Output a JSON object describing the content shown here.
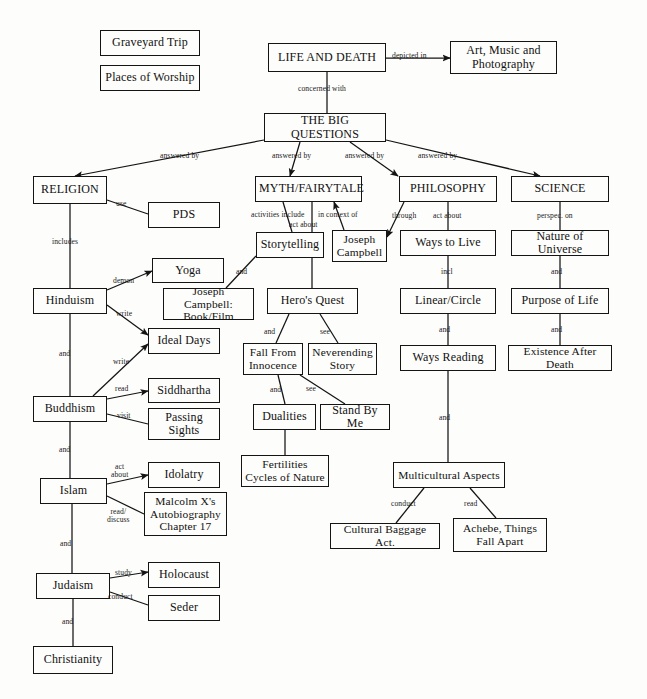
{
  "diagram": {
    "stroke_color": "#141414",
    "background_color": "#fdfdfb",
    "nodes": [
      {
        "id": "graveyard_trip",
        "label": "Graveyard Trip",
        "x": 100,
        "y": 30,
        "w": 100,
        "h": 26,
        "size": "sz-md"
      },
      {
        "id": "places_worship",
        "label": "Places of Worship",
        "x": 100,
        "y": 65,
        "w": 100,
        "h": 26,
        "size": "sz-md"
      },
      {
        "id": "life_and_death",
        "label": "LIFE AND DEATH",
        "x": 268,
        "y": 43,
        "w": 118,
        "h": 29,
        "size": "sz-md"
      },
      {
        "id": "art_music_photography",
        "label": "Art, Music and\nPhotography",
        "x": 450,
        "y": 41,
        "w": 107,
        "h": 33,
        "size": "sz-md"
      },
      {
        "id": "the_big_questions",
        "label": "THE BIG QUESTIONS",
        "x": 264,
        "y": 113,
        "w": 122,
        "h": 29,
        "size": "sz-md"
      },
      {
        "id": "religion",
        "label": "RELIGION",
        "x": 33,
        "y": 176,
        "w": 74,
        "h": 28,
        "size": "sz-md"
      },
      {
        "id": "myth_fairytale",
        "label": "MYTH/FAIRYTALE",
        "x": 255,
        "y": 176,
        "w": 107,
        "h": 26,
        "size": "sz-md"
      },
      {
        "id": "philosophy",
        "label": "PHILOSOPHY",
        "x": 399,
        "y": 176,
        "w": 98,
        "h": 26,
        "size": "sz-md"
      },
      {
        "id": "science",
        "label": "SCIENCE",
        "x": 511,
        "y": 176,
        "w": 98,
        "h": 26,
        "size": "sz-md"
      },
      {
        "id": "pds",
        "label": "PDS",
        "x": 148,
        "y": 202,
        "w": 72,
        "h": 26,
        "size": "sz-md"
      },
      {
        "id": "yoga",
        "label": "Yoga",
        "x": 152,
        "y": 258,
        "w": 72,
        "h": 25,
        "size": "sz-md"
      },
      {
        "id": "joseph_campbell_book",
        "label": "Joseph Campbell:\nBook/Film",
        "x": 163,
        "y": 288,
        "w": 91,
        "h": 32,
        "size": "sz-sm"
      },
      {
        "id": "storytelling",
        "label": "Storytelling",
        "x": 256,
        "y": 232,
        "w": 68,
        "h": 26,
        "size": "sz-md"
      },
      {
        "id": "joseph_campbell",
        "label": "Joseph\nCampbell",
        "x": 332,
        "y": 230,
        "w": 55,
        "h": 32,
        "size": "sz-sm"
      },
      {
        "id": "ways_to_live",
        "label": "Ways to Live",
        "x": 400,
        "y": 230,
        "w": 96,
        "h": 26,
        "size": "sz-md"
      },
      {
        "id": "nature_of_universe",
        "label": "Nature of Universe",
        "x": 511,
        "y": 230,
        "w": 98,
        "h": 26,
        "size": "sz-md"
      },
      {
        "id": "hinduism",
        "label": "Hinduism",
        "x": 33,
        "y": 288,
        "w": 74,
        "h": 26,
        "size": "sz-md"
      },
      {
        "id": "heros_quest",
        "label": "Hero's Quest",
        "x": 267,
        "y": 288,
        "w": 91,
        "h": 26,
        "size": "sz-md"
      },
      {
        "id": "linear_circle",
        "label": "Linear/Circle",
        "x": 400,
        "y": 288,
        "w": 96,
        "h": 26,
        "size": "sz-md"
      },
      {
        "id": "purpose_of_life",
        "label": "Purpose of Life",
        "x": 511,
        "y": 288,
        "w": 98,
        "h": 26,
        "size": "sz-md"
      },
      {
        "id": "ideal_days",
        "label": "Ideal Days",
        "x": 148,
        "y": 328,
        "w": 72,
        "h": 26,
        "size": "sz-md"
      },
      {
        "id": "fall_from_innocence",
        "label": "Fall From\nInnocence",
        "x": 243,
        "y": 343,
        "w": 60,
        "h": 32,
        "size": "sz-sm"
      },
      {
        "id": "neverending_story",
        "label": "Neverending\nStory",
        "x": 308,
        "y": 343,
        "w": 69,
        "h": 32,
        "size": "sz-sm"
      },
      {
        "id": "ways_reading",
        "label": "Ways Reading",
        "x": 400,
        "y": 345,
        "w": 96,
        "h": 26,
        "size": "sz-md"
      },
      {
        "id": "existence_after_death",
        "label": "Existence After Death",
        "x": 508,
        "y": 345,
        "w": 104,
        "h": 26,
        "size": "sz-sm"
      },
      {
        "id": "siddhartha",
        "label": "Siddhartha",
        "x": 148,
        "y": 378,
        "w": 72,
        "h": 25,
        "size": "sz-md"
      },
      {
        "id": "buddhism",
        "label": "Buddhism",
        "x": 33,
        "y": 396,
        "w": 74,
        "h": 26,
        "size": "sz-md"
      },
      {
        "id": "dualities",
        "label": "Dualities",
        "x": 253,
        "y": 404,
        "w": 63,
        "h": 26,
        "size": "sz-md"
      },
      {
        "id": "stand_by_me",
        "label": "Stand By Me",
        "x": 320,
        "y": 404,
        "w": 70,
        "h": 26,
        "size": "sz-md"
      },
      {
        "id": "passing_sights",
        "label": "Passing\nSights",
        "x": 148,
        "y": 408,
        "w": 72,
        "h": 32,
        "size": "sz-md"
      },
      {
        "id": "fertilities_cycles",
        "label": "Fertilities\nCycles of Nature",
        "x": 241,
        "y": 455,
        "w": 88,
        "h": 32,
        "size": "sz-sm"
      },
      {
        "id": "idolatry",
        "label": "Idolatry",
        "x": 148,
        "y": 462,
        "w": 72,
        "h": 26,
        "size": "sz-md"
      },
      {
        "id": "multicultural_aspects",
        "label": "Multicultural Aspects",
        "x": 393,
        "y": 462,
        "w": 112,
        "h": 26,
        "size": "sz-sm"
      },
      {
        "id": "islam",
        "label": "Islam",
        "x": 40,
        "y": 478,
        "w": 67,
        "h": 26,
        "size": "sz-md"
      },
      {
        "id": "malcolm_x",
        "label": "Malcolm X's\nAutobiography\nChapter 17",
        "x": 144,
        "y": 492,
        "w": 83,
        "h": 44,
        "size": "sz-sm"
      },
      {
        "id": "cultural_baggage",
        "label": "Cultural Baggage Act.",
        "x": 330,
        "y": 523,
        "w": 110,
        "h": 26,
        "size": "sz-sm"
      },
      {
        "id": "achebe_things_fall_apart",
        "label": "Achebe, Things\nFall Apart",
        "x": 453,
        "y": 518,
        "w": 94,
        "h": 34,
        "size": "sz-sm"
      },
      {
        "id": "holocaust",
        "label": "Holocaust",
        "x": 148,
        "y": 562,
        "w": 72,
        "h": 26,
        "size": "sz-md"
      },
      {
        "id": "judaism",
        "label": "Judaism",
        "x": 36,
        "y": 573,
        "w": 74,
        "h": 26,
        "size": "sz-md"
      },
      {
        "id": "seder",
        "label": "Seder",
        "x": 148,
        "y": 595,
        "w": 72,
        "h": 26,
        "size": "sz-md"
      },
      {
        "id": "christianity",
        "label": "Christianity",
        "x": 33,
        "y": 646,
        "w": 80,
        "h": 28,
        "size": "sz-md"
      }
    ],
    "edges": [
      {
        "id": "e1",
        "from": "life_and_death",
        "to": "art_music_photography",
        "label": "depicted in",
        "lx": 392,
        "ly": 52,
        "arrow": true,
        "pts": "386,58 450,58"
      },
      {
        "id": "e2",
        "from": "life_and_death",
        "to": "the_big_questions",
        "label": "concerned with",
        "lx": 298,
        "ly": 85,
        "arrow": false,
        "pts": "327,72 327,113"
      },
      {
        "id": "e3",
        "from": "the_big_questions",
        "to": "religion",
        "label": "answered by",
        "lx": 160,
        "ly": 152,
        "arrow": true,
        "pts": "264,140 75,176"
      },
      {
        "id": "e4",
        "from": "the_big_questions",
        "to": "myth_fairytale",
        "label": "answered by",
        "lx": 272,
        "ly": 152,
        "arrow": true,
        "pts": "300,142 290,176"
      },
      {
        "id": "e5",
        "from": "the_big_questions",
        "to": "philosophy",
        "label": "answered by",
        "lx": 345,
        "ly": 152,
        "arrow": true,
        "pts": "350,142 398,176"
      },
      {
        "id": "e6",
        "from": "the_big_questions",
        "to": "science",
        "label": "answered by",
        "lx": 418,
        "ly": 152,
        "arrow": true,
        "pts": "386,140 540,176"
      },
      {
        "id": "e7",
        "from": "religion",
        "to": "pds",
        "label": "use",
        "lx": 116,
        "ly": 200,
        "arrow": false,
        "pts": "107,200 148,214"
      },
      {
        "id": "e8",
        "from": "religion",
        "to": "hinduism",
        "label": "includes",
        "lx": 52,
        "ly": 238,
        "arrow": false,
        "pts": "70,204 70,288"
      },
      {
        "id": "e9",
        "from": "hinduism",
        "to": "yoga",
        "label": "demon",
        "lx": 113,
        "ly": 277,
        "arrow": true,
        "pts": "107,290 152,271"
      },
      {
        "id": "e10",
        "from": "hinduism",
        "to": "ideal_days",
        "label": "write",
        "lx": 116,
        "ly": 310,
        "arrow": true,
        "pts": "107,305 148,335"
      },
      {
        "id": "e11",
        "from": "hinduism",
        "to": "buddhism",
        "label": "and",
        "lx": 59,
        "ly": 350,
        "arrow": false,
        "pts": "70,314 70,396"
      },
      {
        "id": "e12",
        "from": "buddhism",
        "to": "ideal_days",
        "label": "write",
        "lx": 113,
        "ly": 358,
        "arrow": true,
        "pts": "93,396 148,344"
      },
      {
        "id": "e13",
        "from": "buddhism",
        "to": "siddhartha",
        "label": "read",
        "lx": 115,
        "ly": 385,
        "arrow": true,
        "pts": "107,399 148,391"
      },
      {
        "id": "e14",
        "from": "buddhism",
        "to": "passing_sights",
        "label": "visit",
        "lx": 117,
        "ly": 412,
        "arrow": false,
        "pts": "107,414 148,424"
      },
      {
        "id": "e15",
        "from": "buddhism",
        "to": "islam",
        "label": "and",
        "lx": 59,
        "ly": 446,
        "arrow": false,
        "pts": "70,422 70,478"
      },
      {
        "id": "e16",
        "from": "islam",
        "to": "idolatry",
        "label": "act\nabout",
        "lx": 111,
        "ly": 463,
        "arrow": true,
        "pts": "107,484 148,475"
      },
      {
        "id": "e17",
        "from": "islam",
        "to": "malcolm_x",
        "label": "read/\ndiscuss",
        "lx": 107,
        "ly": 508,
        "arrow": false,
        "pts": "107,496 144,514"
      },
      {
        "id": "e18",
        "from": "islam",
        "to": "judaism",
        "label": "and",
        "lx": 60,
        "ly": 540,
        "arrow": false,
        "pts": "72,504 72,573"
      },
      {
        "id": "e19",
        "from": "judaism",
        "to": "holocaust",
        "label": "study",
        "lx": 115,
        "ly": 569,
        "arrow": true,
        "pts": "110,578 148,572"
      },
      {
        "id": "e20",
        "from": "judaism",
        "to": "seder",
        "label": "conduct",
        "lx": 108,
        "ly": 593,
        "arrow": false,
        "pts": "110,592 148,605"
      },
      {
        "id": "e21",
        "from": "judaism",
        "to": "christianity",
        "label": "and",
        "lx": 62,
        "ly": 618,
        "arrow": false,
        "pts": "73,599 73,646"
      },
      {
        "id": "e22",
        "from": "myth_fairytale",
        "to": "storytelling",
        "label": "activities include",
        "lx": 251,
        "ly": 211,
        "arrow": false,
        "pts": "283,202 292,232"
      },
      {
        "id": "e23",
        "from": "myth_fairytale",
        "to": "heros_quest",
        "label": "in context of",
        "lx": 318,
        "ly": 211,
        "arrow": false,
        "pts": "312,202 312,288"
      },
      {
        "id": "e24",
        "from": "joseph_campbell",
        "to": "myth_fairytale",
        "label": "act about",
        "lx": 289,
        "ly": 221,
        "arrow": true,
        "pts": "344,230 334,202"
      },
      {
        "id": "e25",
        "from": "philosophy",
        "to": "joseph_campbell",
        "label": "through",
        "lx": 392,
        "ly": 212,
        "arrow": true,
        "pts": "404,202 387,237"
      },
      {
        "id": "e26",
        "from": "storytelling",
        "to": "joseph_campbell_book",
        "label": "and",
        "lx": 236,
        "ly": 268,
        "arrow": false,
        "pts": "256,256 226,288"
      },
      {
        "id": "e27",
        "from": "heros_quest",
        "to": "fall_from_innocence",
        "label": "and",
        "lx": 264,
        "ly": 328,
        "arrow": false,
        "pts": "289,314 276,343"
      },
      {
        "id": "e28",
        "from": "heros_quest",
        "to": "neverending_story",
        "label": "see",
        "lx": 320,
        "ly": 328,
        "arrow": false,
        "pts": "320,314 338,343"
      },
      {
        "id": "e29",
        "from": "fall_from_innocence",
        "to": "dualities",
        "label": "and",
        "lx": 270,
        "ly": 386,
        "arrow": false,
        "pts": "278,375 285,404"
      },
      {
        "id": "e30",
        "from": "fall_from_innocence",
        "to": "stand_by_me",
        "label": "see",
        "lx": 306,
        "ly": 385,
        "arrow": false,
        "pts": "300,375 345,404"
      },
      {
        "id": "e31",
        "from": "dualities",
        "to": "fertilities_cycles",
        "label": "",
        "lx": 0,
        "ly": 0,
        "arrow": false,
        "pts": "285,430 285,455"
      },
      {
        "id": "e32",
        "from": "philosophy",
        "to": "ways_to_live",
        "label": "act about",
        "lx": 433,
        "ly": 212,
        "arrow": false,
        "pts": "448,202 448,230"
      },
      {
        "id": "e33",
        "from": "ways_to_live",
        "to": "linear_circle",
        "label": "incl",
        "lx": 441,
        "ly": 268,
        "arrow": false,
        "pts": "448,256 448,288"
      },
      {
        "id": "e34",
        "from": "linear_circle",
        "to": "ways_reading",
        "label": "and",
        "lx": 439,
        "ly": 326,
        "arrow": false,
        "pts": "448,314 448,345"
      },
      {
        "id": "e35",
        "from": "ways_reading",
        "to": "multicultural_aspects",
        "label": "and",
        "lx": 439,
        "ly": 414,
        "arrow": false,
        "pts": "448,371 448,462"
      },
      {
        "id": "e36",
        "from": "science",
        "to": "nature_of_universe",
        "label": "perspec. on",
        "lx": 537,
        "ly": 212,
        "arrow": false,
        "pts": "560,202 560,230"
      },
      {
        "id": "e37",
        "from": "nature_of_universe",
        "to": "purpose_of_life",
        "label": "and",
        "lx": 551,
        "ly": 268,
        "arrow": false,
        "pts": "560,256 560,288"
      },
      {
        "id": "e38",
        "from": "purpose_of_life",
        "to": "existence_after_death",
        "label": "and",
        "lx": 551,
        "ly": 326,
        "arrow": false,
        "pts": "560,314 560,345"
      },
      {
        "id": "e39",
        "from": "multicultural_aspects",
        "to": "cultural_baggage",
        "label": "conduct",
        "lx": 391,
        "ly": 500,
        "arrow": false,
        "pts": "424,488 396,523"
      },
      {
        "id": "e40",
        "from": "multicultural_aspects",
        "to": "achebe_things_fall_apart",
        "label": "read",
        "lx": 464,
        "ly": 500,
        "arrow": false,
        "pts": "470,488 496,518"
      }
    ]
  }
}
